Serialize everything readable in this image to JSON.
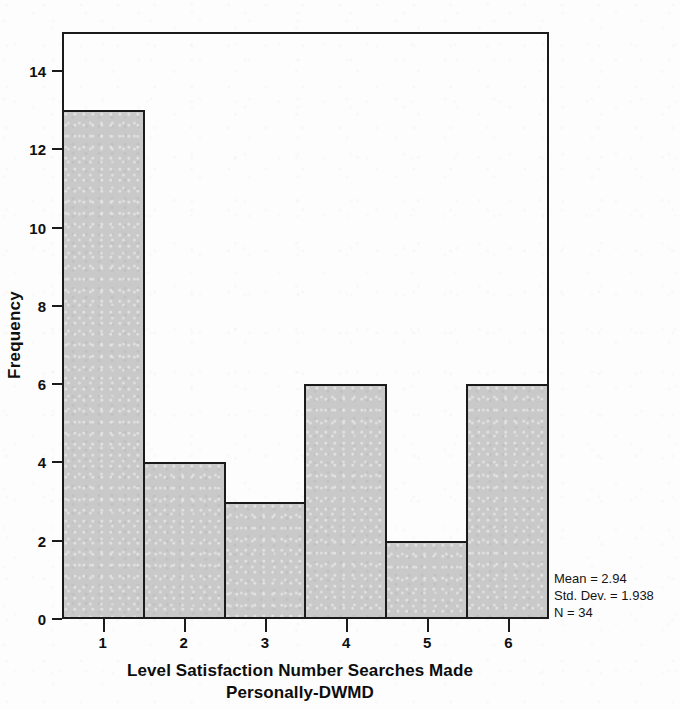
{
  "chart_data": {
    "type": "bar",
    "title": "",
    "subtitle": "",
    "xlabel_lines": [
      "Level Satisfaction Number Searches Made",
      "Personally-DWMD"
    ],
    "xlabel": "Level Satisfaction Number Searches Made Personally-DWMD",
    "ylabel": "Frequency",
    "categories": [
      "1",
      "2",
      "3",
      "4",
      "5",
      "6"
    ],
    "values": [
      13,
      4,
      3,
      6,
      2,
      6
    ],
    "ylim": [
      0,
      15
    ],
    "xticks": [
      "1",
      "2",
      "3",
      "4",
      "5",
      "6"
    ],
    "yticks": [
      "0",
      "2",
      "4",
      "6",
      "8",
      "10",
      "12",
      "14"
    ],
    "ytick_values": [
      0,
      2,
      4,
      6,
      8,
      10,
      12,
      14
    ],
    "grid": false,
    "legend": null,
    "legend_position": "none",
    "bar_fill_color": "#c9c9c9",
    "bar_border_color": "#1b1b1b",
    "annotations": {
      "mean_label": "Mean = 2.94",
      "std_dev_label": "Std. Dev. = 1.938",
      "n_label": "N = 34",
      "mean": 2.94,
      "std_dev": 1.938,
      "n": 34
    }
  }
}
